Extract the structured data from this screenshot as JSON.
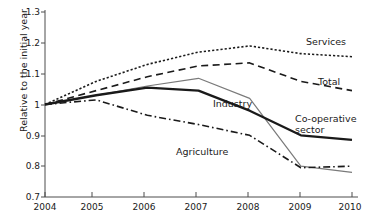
{
  "chart_data": {
    "type": "line",
    "title": "",
    "xlabel": "",
    "ylabel": "Relative to the initial year",
    "x": [
      2004,
      2005,
      2006,
      2007,
      2008,
      2009,
      2010
    ],
    "xticklabels": [
      "2004",
      "2005",
      "2006",
      "2007",
      "2008",
      "2009",
      "2010"
    ],
    "yticklabels": [
      "0.7",
      "0.8",
      "0.9",
      "1",
      "1.1",
      "1.2",
      "1.3"
    ],
    "ylim": [
      0.7,
      1.3
    ],
    "xlim": [
      2004,
      2010
    ],
    "grid": false,
    "legend_position": "inline-right-annotations",
    "series": [
      {
        "name": "Services",
        "label": "Services",
        "style": "dotted",
        "color": "#1a1a1a",
        "values": [
          1.0,
          1.075,
          1.13,
          1.17,
          1.19,
          1.165,
          1.155
        ]
      },
      {
        "name": "Total",
        "label": "Total",
        "style": "dashed",
        "color": "#1a1a1a",
        "values": [
          1.0,
          1.045,
          1.09,
          1.125,
          1.135,
          1.075,
          1.045
        ]
      },
      {
        "name": "Industry",
        "label": "Industry",
        "style": "solid-thin",
        "color": "#7a7a7a",
        "values": [
          1.0,
          1.03,
          1.06,
          1.085,
          1.02,
          0.8,
          0.78
        ]
      },
      {
        "name": "Co-operative sector",
        "label": "Co-operative sector",
        "style": "solid-thick",
        "color": "#1a1a1a",
        "values": [
          1.0,
          1.03,
          1.055,
          1.045,
          0.98,
          0.9,
          0.885
        ]
      },
      {
        "name": "Agriculture",
        "label": "Agriculture",
        "style": "dash-dot",
        "color": "#1a1a1a",
        "values": [
          1.0,
          1.015,
          0.965,
          0.935,
          0.9,
          0.795,
          0.8
        ]
      }
    ],
    "annotations": [
      {
        "text": "Services",
        "x": 2009.3,
        "y": 1.225
      },
      {
        "text": "Total",
        "x": 2009.5,
        "y": 1.095
      },
      {
        "text": "Industry",
        "x": 2007.5,
        "y": 1.005
      },
      {
        "text": "Co-operative sector",
        "x": 2009.1,
        "y": 0.965
      },
      {
        "text": "Agriculture",
        "x": 2006.7,
        "y": 0.865
      }
    ]
  }
}
